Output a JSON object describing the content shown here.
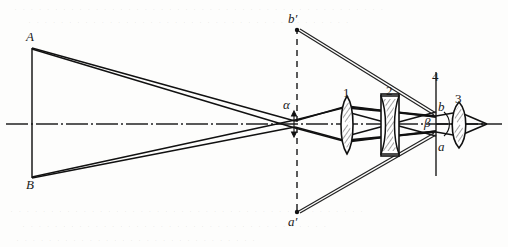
{
  "figure": {
    "background_color": "#fdfdfc",
    "ink_color": "#1a1a1a",
    "width": 508,
    "height": 247
  },
  "labels": {
    "object_top": "A",
    "object_bottom": "B",
    "intermediate_top": "b′",
    "intermediate_bottom": "a′",
    "image_top": "b",
    "image_bottom": "a",
    "angle_object": "α",
    "angle_image": "β",
    "lens_1": "1",
    "lens_2": "2",
    "lens_3": "3",
    "plane_4": "4"
  },
  "elements": [
    {
      "id": "object-line",
      "name": "object AB",
      "type": "vertical-line",
      "x": 32,
      "y_top": 48,
      "y_bottom": 178,
      "style": "solid"
    },
    {
      "id": "optical-axis",
      "name": "optical axis",
      "type": "horizontal-line",
      "y": 124,
      "x_start": 6,
      "x_end": 502,
      "style": "dash-dot"
    },
    {
      "id": "intermediate-plane",
      "name": "intermediate image plane a'b'",
      "type": "vertical-line",
      "x": 297,
      "y_top": 28,
      "y_bottom": 214,
      "style": "dashed"
    },
    {
      "id": "lens-1",
      "name": "objective lens 1",
      "type": "biconvex",
      "x": 347,
      "y_top": 96,
      "y_bottom": 154
    },
    {
      "id": "lens-2",
      "name": "field lens 2 in mount",
      "type": "biconcave-mounted",
      "x": 390,
      "y_top": 94,
      "y_bottom": 156
    },
    {
      "id": "plane-4",
      "name": "reticle plane 4",
      "type": "vertical-line",
      "x": 436,
      "y_top": 72,
      "y_bottom": 176,
      "style": "solid"
    },
    {
      "id": "lens-3",
      "name": "eyepiece lens 3",
      "type": "biconvex",
      "x": 459,
      "y_top": 102,
      "y_bottom": 148
    },
    {
      "id": "exit-point",
      "name": "exit pupil / focal point",
      "type": "point",
      "x": 487,
      "y": 124
    }
  ],
  "bleed_text": {
    "top_line_1": "· · · · · · · · · · · · · · · · · · · · · · · · · · · · · · · · · · · · · · · · · · · · · ·",
    "top_line_2": "· · · · · · · · · · · · · · · · · · · · · · · · · · · · · · · · · · · · · · · ·",
    "bottom_line_1": "· · · · · · · · · · · · · · · · · · · · · · · · · · · · · · · · · · · · · · · · · · · ·",
    "bottom_line_2": "· · · · · · · · · · · · · · · · · · · · · · · · · · · · · · · · · · · · · ·",
    "bottom_line_3": "· · · · · · · · · · · · · · · · · · · · · · · · · · · · · ·"
  }
}
